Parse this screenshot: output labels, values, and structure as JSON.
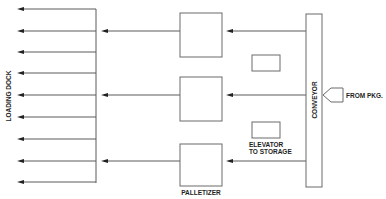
{
  "diagram": {
    "labels": {
      "loading_dock": "LOADING DOCK",
      "conveyor": "CONVEYOR",
      "from_pkg": "FROM PKG.",
      "elevator_line1": "ELEVATOR",
      "elevator_line2": "TO STORAGE",
      "palletizer": "PALLETIZER"
    },
    "loading_dock_outputs": 9,
    "palletizer_units": 3,
    "elevator_units": 2
  }
}
